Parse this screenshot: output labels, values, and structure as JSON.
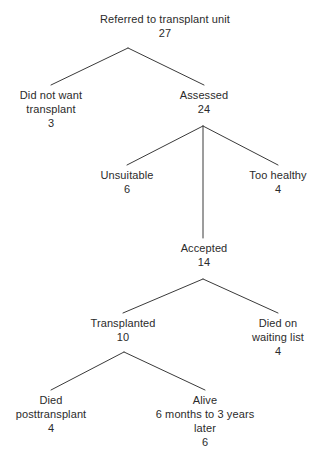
{
  "diagram": {
    "type": "flow-tree",
    "title": "Referred to transplant unit",
    "colors": {
      "background": "#ffffff",
      "text": "#2b2b2b",
      "edge": "#3a3a3a"
    },
    "nodes": [
      {
        "id": "referred",
        "lines": [
          "Referred to transplant unit"
        ],
        "count": "27",
        "x": 165,
        "y": 12
      },
      {
        "id": "did-not-want-transplant",
        "lines": [
          "Did not want",
          "transplant"
        ],
        "count": "3",
        "x": 51,
        "y": 88
      },
      {
        "id": "assessed",
        "lines": [
          "Assessed"
        ],
        "count": "24",
        "x": 204,
        "y": 88
      },
      {
        "id": "unsuitable",
        "lines": [
          "Unsuitable"
        ],
        "count": "6",
        "x": 127,
        "y": 168
      },
      {
        "id": "too-healthy",
        "lines": [
          "Too healthy"
        ],
        "count": "4",
        "x": 278,
        "y": 168
      },
      {
        "id": "accepted",
        "lines": [
          "Accepted"
        ],
        "count": "14",
        "x": 204,
        "y": 241
      },
      {
        "id": "transplanted",
        "lines": [
          "Transplanted"
        ],
        "count": "10",
        "x": 123,
        "y": 316
      },
      {
        "id": "died-on-waiting-list",
        "lines": [
          "Died on",
          "waiting list"
        ],
        "count": "4",
        "x": 278,
        "y": 316
      },
      {
        "id": "died-posttransplant",
        "lines": [
          "Died",
          "posttransplant"
        ],
        "count": "4",
        "x": 51,
        "y": 393
      },
      {
        "id": "alive",
        "lines": [
          "Alive",
          "6 months to 3 years",
          "later"
        ],
        "count": "6",
        "x": 205,
        "y": 393
      }
    ],
    "edges": [
      {
        "id": "referred-to-did-not-want",
        "from": "referred",
        "to": "did-not-want-transplant",
        "points": "128,48 51,85"
      },
      {
        "id": "referred-to-assessed",
        "from": "referred",
        "to": "assessed",
        "points": "128,48 204,85"
      },
      {
        "id": "assessed-to-unsuitable",
        "from": "assessed",
        "to": "unsuitable",
        "points": "203,126 127,165"
      },
      {
        "id": "assessed-to-accepted",
        "from": "assessed",
        "to": "accepted",
        "points": "203,126 203,238"
      },
      {
        "id": "assessed-to-too-healthy",
        "from": "assessed",
        "to": "too-healthy",
        "points": "203,126 278,165"
      },
      {
        "id": "accepted-to-transplanted",
        "from": "accepted",
        "to": "transplanted",
        "points": "203,279 123,313"
      },
      {
        "id": "accepted-to-died-waiting",
        "from": "accepted",
        "to": "died-on-waiting-list",
        "points": "203,279 278,313"
      },
      {
        "id": "transplanted-to-died-post",
        "from": "transplanted",
        "to": "died-posttransplant",
        "points": "124,352 51,390"
      },
      {
        "id": "transplanted-to-alive",
        "from": "transplanted",
        "to": "alive",
        "points": "124,352 205,390"
      }
    ]
  }
}
